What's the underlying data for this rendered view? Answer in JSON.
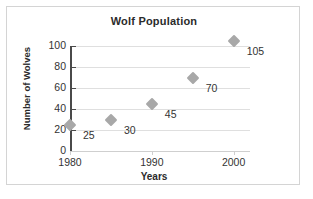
{
  "chart_data": {
    "type": "scatter",
    "title": "Wolf Population",
    "xlabel": "Years",
    "ylabel": "Number of Wolves",
    "x": [
      1980,
      1985,
      1990,
      1995,
      2000
    ],
    "values": [
      25,
      30,
      45,
      70,
      105
    ],
    "point_labels": [
      "25",
      "30",
      "45",
      "70",
      "105"
    ],
    "xlim": [
      1980,
      2002
    ],
    "ylim": [
      0,
      100
    ],
    "xticks": [
      "1980",
      "1990",
      "2000"
    ],
    "yticks": [
      "0",
      "20",
      "40",
      "60",
      "80",
      "100"
    ],
    "grid": true,
    "legend": false,
    "marker_color": "#a8a8a8",
    "axis_color": "#4a4a4a",
    "grid_color": "#dfdfdf",
    "text_color": "#333333",
    "frame_color": "#d4d4d4"
  }
}
